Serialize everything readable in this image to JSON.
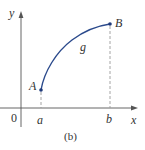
{
  "figure": {
    "caption": "(b)",
    "axes": {
      "x_label": "x",
      "y_label": "y",
      "origin_label": "0"
    },
    "ticks": {
      "a_label": "a",
      "b_label": "b"
    },
    "curve": {
      "name": "g",
      "start_point_label": "A",
      "end_point_label": "B",
      "shape": "increasing, concave down"
    },
    "colors": {
      "curve": "#2b4a8c",
      "axes": "#555555",
      "dashed": "#9a9a9a",
      "text": "#333333"
    }
  }
}
